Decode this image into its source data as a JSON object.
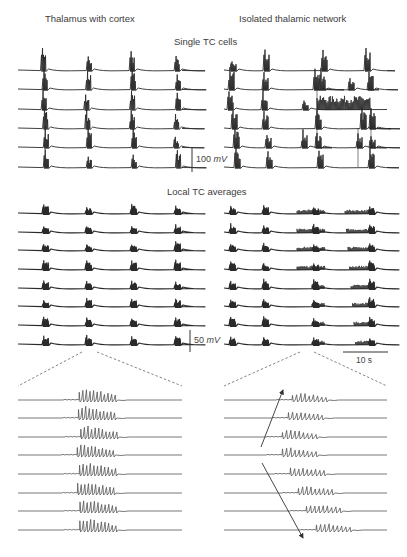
{
  "figure": {
    "column_titles": [
      "Thalamus with cortex",
      "Isolated thalamic network"
    ],
    "sections": {
      "single": {
        "title": "Single TC cells",
        "row_count": 6
      },
      "averages": {
        "title": "Local TC averages",
        "row_count": 8
      },
      "zoomed": {
        "row_count": 8
      }
    },
    "scale_bars": {
      "voltage_single": {
        "value": "100",
        "unit": "mV"
      },
      "voltage_avg": {
        "value": "50",
        "unit": "mV"
      },
      "time": {
        "label": "10 s"
      }
    },
    "annotations": {
      "left_zoom_source": "second burst of thalamus-with-cortex averages (expanded below with dashed lines)",
      "right_zoom_source": "second burst of isolated-network averages (expanded below with dashed lines)",
      "right_arrows": [
        "upward propagation arrow",
        "downward propagation arrow"
      ]
    },
    "colors": {
      "trace": "#2a2a2a",
      "zoom_trace": "#555555",
      "dashed": "#666666"
    }
  },
  "chart_data": [
    {
      "type": "line",
      "title": "Single TC cells — Thalamus with cortex",
      "series_count": 6,
      "burst_times_fraction": [
        0.14,
        0.38,
        0.62,
        0.87
      ],
      "description": "Synchronized spike bursts across all 6 cells at ~4 regular intervals",
      "scale": "100 mV"
    },
    {
      "type": "line",
      "title": "Single TC cells — Isolated thalamic network",
      "series_count": 6,
      "description": "Less synchronized bursts; row 3 shows sustained high-frequency firing in the latter half",
      "scale": "100 mV"
    },
    {
      "type": "line",
      "title": "Local TC averages — Thalamus with cortex",
      "series_count": 8,
      "burst_times_fraction": [
        0.14,
        0.38,
        0.62,
        0.87
      ],
      "scale": "50 mV"
    },
    {
      "type": "line",
      "title": "Local TC averages — Isolated thalamic network",
      "series_count": 8,
      "description": "Bursts with irregular, drifting activity in later segments",
      "scale": "50 mV",
      "time_scale": "10 s"
    },
    {
      "type": "line",
      "title": "Expanded burst — Thalamus with cortex",
      "series_count": 8,
      "description": "Spindle oscillations aligned across all traces (synchronous onset)"
    },
    {
      "type": "line",
      "title": "Expanded burst — Isolated thalamic network",
      "series_count": 8,
      "description": "Spindle onset propagates from middle traces outward (traveling wave, indicated by arrows)"
    }
  ]
}
